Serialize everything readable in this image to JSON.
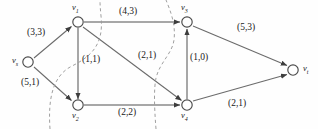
{
  "figure": {
    "type": "network-flow-diagram",
    "background_color": "#fefefe",
    "line_color": "#5a5a5a",
    "text_color": "#1a1a1a",
    "dash_color": "#8a8a8a"
  },
  "nodes": [
    {
      "id": "vs",
      "label": "v",
      "sub": "s",
      "x": 28,
      "y": 62,
      "label_x": 12,
      "label_y": 55,
      "role": "source"
    },
    {
      "id": "v1",
      "label": "v",
      "sub": "1",
      "x": 78,
      "y": 22,
      "label_x": 72,
      "label_y": 2,
      "role": "intermediate"
    },
    {
      "id": "v2",
      "label": "v",
      "sub": "2",
      "x": 78,
      "y": 105,
      "label_x": 72,
      "label_y": 110,
      "role": "intermediate"
    },
    {
      "id": "v3",
      "label": "v",
      "sub": "3",
      "x": 187,
      "y": 22,
      "label_x": 181,
      "label_y": 2,
      "role": "intermediate"
    },
    {
      "id": "v4",
      "label": "v",
      "sub": "4",
      "x": 187,
      "y": 105,
      "label_x": 181,
      "label_y": 110,
      "role": "intermediate"
    },
    {
      "id": "vt",
      "label": "v",
      "sub": "t",
      "x": 293,
      "y": 70,
      "label_x": 303,
      "label_y": 63,
      "role": "sink"
    }
  ],
  "edges": [
    {
      "from": "vs",
      "to": "v1",
      "capacity": 3,
      "flow": 3,
      "label": "(3,3)",
      "label_x": 27,
      "label_y": 27
    },
    {
      "from": "vs",
      "to": "v2",
      "capacity": 5,
      "flow": 1,
      "label": "(5,1)",
      "label_x": 21,
      "label_y": 77
    },
    {
      "from": "v1",
      "to": "v3",
      "capacity": 4,
      "flow": 3,
      "label": "(4,3)",
      "label_x": 119,
      "label_y": 6
    },
    {
      "from": "v1",
      "to": "v2",
      "capacity": 1,
      "flow": 1,
      "label": "(1,1)",
      "label_x": 82,
      "label_y": 54
    },
    {
      "from": "v1",
      "to": "v4",
      "capacity": 2,
      "flow": 1,
      "label": "(2,1)",
      "label_x": 138,
      "label_y": 50
    },
    {
      "from": "v2",
      "to": "v4",
      "capacity": 2,
      "flow": 2,
      "label": "(2,2)",
      "label_x": 118,
      "label_y": 107
    },
    {
      "from": "v4",
      "to": "v3",
      "capacity": 1,
      "flow": 0,
      "label": "(1,0)",
      "label_x": 190,
      "label_y": 52
    },
    {
      "from": "v3",
      "to": "vt",
      "capacity": 5,
      "flow": 3,
      "label": "(5,3)",
      "label_x": 237,
      "label_y": 22
    },
    {
      "from": "v4",
      "to": "vt",
      "capacity": 2,
      "flow": 1,
      "label": "(2,1)",
      "label_x": 228,
      "label_y": 98
    }
  ],
  "cuts": [
    {
      "name": "cut-left",
      "path": "M 50 129 C 48 100, 52 76, 72 66 C 92 56, 104 44, 101 16 C 100 6, 100 2, 100 0"
    },
    {
      "name": "cut-right",
      "path": "M 156 129 C 154 104, 154 88, 156 78 C 160 62, 172 54, 174 40 C 176 24, 170 10, 166 0"
    }
  ]
}
